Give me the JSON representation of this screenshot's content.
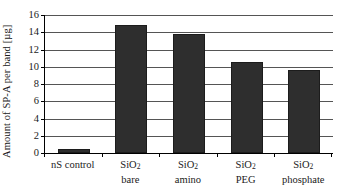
{
  "chart_data": {
    "type": "bar",
    "title": "",
    "xlabel": "",
    "ylabel": "Amount of SP-A per band [µg]",
    "ylim": [
      0,
      16
    ],
    "ytick_step": 2,
    "ytick_labels": [
      "16",
      "14",
      "12",
      "10",
      "8",
      "6",
      "4",
      "2",
      "0"
    ],
    "ytick_values": [
      16,
      14,
      12,
      10,
      8,
      6,
      4,
      2,
      0
    ],
    "grid": true,
    "grid_axis": "y",
    "legend": "none",
    "categories": [
      "nS control",
      "SiO2 bare",
      "SiO2 amino",
      "SiO2 PEG",
      "SiO2 phosphate"
    ],
    "category_lines": [
      {
        "line1": "nS control",
        "line2": ""
      },
      {
        "line1": "SiO",
        "sub1": "2",
        "line2": "bare"
      },
      {
        "line1": "SiO",
        "sub1": "2",
        "line2": "amino"
      },
      {
        "line1": "SiO",
        "sub1": "2",
        "line2": "PEG"
      },
      {
        "line1": "SiO",
        "sub1": "2",
        "line2": "phosphate"
      }
    ],
    "values": [
      0.45,
      14.9,
      13.8,
      10.6,
      9.6
    ],
    "bar_color": "#2e2e2e",
    "grid_color": "#555555",
    "axis_color": "#000000",
    "background": "#ffffff"
  },
  "axis": {
    "y_title": "Amount of SP-A per band [µg]",
    "tick_0": "0",
    "tick_2": "2",
    "tick_4": "4",
    "tick_6": "6",
    "tick_8": "8",
    "tick_10": "10",
    "tick_12": "12",
    "tick_14": "14",
    "tick_16": "16"
  },
  "labels": {
    "cat0_line1": "nS control",
    "cat0_line2": "",
    "cat1_line1": "SiO",
    "cat1_sub": "2",
    "cat1_line2": "bare",
    "cat2_line1": "SiO",
    "cat2_sub": "2",
    "cat2_line2": "amino",
    "cat3_line1": "SiO",
    "cat3_sub": "2",
    "cat3_line2": "PEG",
    "cat4_line1": "SiO",
    "cat4_sub": "2",
    "cat4_line2": "phosphate"
  }
}
